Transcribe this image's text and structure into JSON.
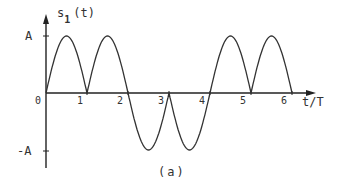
{
  "figure": {
    "y_label_main": "s",
    "y_label_sub": "1",
    "y_label_arg": "(t)",
    "x_label": "t/T",
    "caption": "(a)",
    "y_tick_pos": "A",
    "y_tick_neg": "-A",
    "origin_label": "0",
    "x_ticks": [
      "1",
      "2",
      "3",
      "4",
      "5",
      "6"
    ],
    "line_color": "#333333"
  },
  "chart_data": {
    "type": "line",
    "title": "",
    "xlabel": "t/T",
    "ylabel": "s1(t)",
    "caption": "(a)",
    "x_ticks": [
      0,
      1,
      2,
      3,
      4,
      5,
      6
    ],
    "y_ticks": [
      "-A",
      "0",
      "A"
    ],
    "pulses": [
      {
        "start": 0,
        "end": 1,
        "sign": 1
      },
      {
        "start": 1,
        "end": 2,
        "sign": 1
      },
      {
        "start": 2,
        "end": 3,
        "sign": -1
      },
      {
        "start": 3,
        "end": 4,
        "sign": -1
      },
      {
        "start": 4,
        "end": 5,
        "sign": 1
      },
      {
        "start": 5,
        "end": 6,
        "sign": 1
      }
    ],
    "amplitude": "A",
    "grid": false
  }
}
